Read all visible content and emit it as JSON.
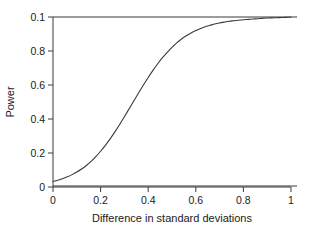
{
  "chart_data": {
    "type": "line",
    "title": "",
    "xlabel": "Difference in standard deviations",
    "ylabel": "Power",
    "xlim": [
      0,
      1
    ],
    "ylim": [
      0,
      1
    ],
    "grid": false,
    "legend": "none",
    "background_color": "#ffffff",
    "line_color": "#3a3a3a",
    "axis_color": "#3a3a3a",
    "text_color": "#1a1a1a",
    "xticks": [
      0,
      0.2,
      0.4,
      0.6,
      0.8,
      1
    ],
    "xtick_labels": [
      "0",
      "0.2",
      "0.4",
      "0.6",
      "0.8",
      "1"
    ],
    "yticks": [
      0,
      0.2,
      0.4,
      0.6,
      0.8,
      1
    ],
    "ytick_labels": [
      "0",
      "0.2",
      "0.4",
      "0.6",
      "0.8",
      "0.1"
    ],
    "series": [
      {
        "name": "Power curve",
        "kind": "line",
        "x": [
          0.0,
          0.02,
          0.04,
          0.06,
          0.08,
          0.1,
          0.12,
          0.14,
          0.16,
          0.18,
          0.2,
          0.22,
          0.24,
          0.26,
          0.28,
          0.3,
          0.32,
          0.34,
          0.36,
          0.38,
          0.4,
          0.42,
          0.44,
          0.46,
          0.48,
          0.5,
          0.52,
          0.54,
          0.56,
          0.58,
          0.6,
          0.62,
          0.64,
          0.66,
          0.68,
          0.7,
          0.72,
          0.74,
          0.76,
          0.78,
          0.8,
          0.82,
          0.84,
          0.86,
          0.88,
          0.9,
          0.92,
          0.94,
          0.96,
          0.98,
          1.0
        ],
        "values": [
          0.03,
          0.037,
          0.046,
          0.057,
          0.07,
          0.085,
          0.103,
          0.124,
          0.148,
          0.176,
          0.208,
          0.243,
          0.281,
          0.322,
          0.366,
          0.412,
          0.459,
          0.506,
          0.553,
          0.599,
          0.643,
          0.685,
          0.724,
          0.76,
          0.792,
          0.821,
          0.847,
          0.87,
          0.889,
          0.906,
          0.92,
          0.932,
          0.943,
          0.951,
          0.959,
          0.965,
          0.97,
          0.975,
          0.978,
          0.981,
          0.984,
          0.986,
          0.988,
          0.99,
          0.992,
          0.994,
          0.995,
          0.996,
          0.997,
          0.998,
          1.0
        ]
      },
      {
        "name": "Upper reference line",
        "kind": "hline",
        "values": [
          1.0,
          1.0
        ]
      },
      {
        "name": "Lower reference line",
        "kind": "hline",
        "values": [
          0.0,
          0.0
        ]
      }
    ]
  }
}
